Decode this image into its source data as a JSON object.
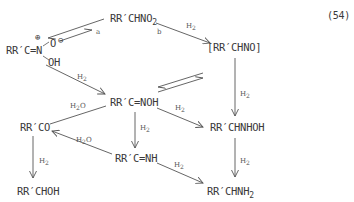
{
  "equation_number": "(54)",
  "compounds": {
    "nitro": {
      "text": "RR′CHNO",
      "sub": "2"
    },
    "aci_nitro": {
      "main": "RR′C=N",
      "plus": "⊕",
      "oxide": "O",
      "minus": "⊖",
      "oh": "OH"
    },
    "nitroso": {
      "text": "[RR′CHNO]"
    },
    "oxime": {
      "text": "RR′C=NOH"
    },
    "ketone": {
      "text": "RR′CO"
    },
    "hydroxylamine": {
      "text": "RR′CHNHOH"
    },
    "imine": {
      "text": "RR′C=NH"
    },
    "alcohol": {
      "text": "RR′CHOH"
    },
    "amine": {
      "text": "RR′CHNH",
      "sub": "2"
    }
  },
  "arrow_labels": {
    "a": "a",
    "b": "b",
    "h2": "H",
    "h2_sub": "2",
    "h2o": "H",
    "h2o_sub": "2",
    "h2o_o": "O"
  },
  "colors": {
    "line": "#555555",
    "text": "#3a3a3a"
  }
}
